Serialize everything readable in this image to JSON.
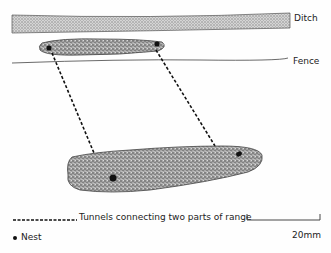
{
  "labels": {
    "ditch": "Ditch",
    "fence": "Fence"
  },
  "legend": {
    "tunnels": "Tunnels connecting two parts of range",
    "nest": "Nest",
    "scale": "20mm"
  },
  "colors": {
    "stipple_fill": "#9a9a9a",
    "ditch_fill": "#c8c8c8",
    "line": "#333333"
  }
}
